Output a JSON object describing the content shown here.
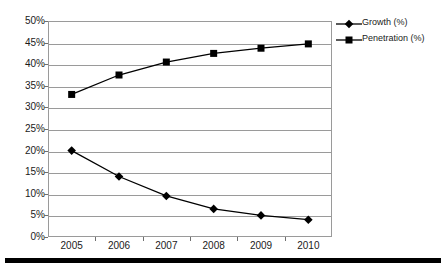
{
  "chart_data": {
    "type": "line",
    "title": "",
    "subtitle": "",
    "xlabel": "",
    "ylabel": "",
    "categories": [
      "2005",
      "2006",
      "2007",
      "2008",
      "2009",
      "2010"
    ],
    "series": [
      {
        "name": "Growth (%)",
        "marker": "diamond",
        "color": "#000000",
        "values": [
          20,
          14,
          9.5,
          6.5,
          5,
          4
        ]
      },
      {
        "name": "Penetration (%)",
        "marker": "square",
        "color": "#000000",
        "values": [
          33,
          37.5,
          40.5,
          42.5,
          43.7,
          44.7
        ]
      }
    ],
    "ylim": [
      0,
      50
    ],
    "ytick_step": 5,
    "ytick_labels": [
      "50%",
      "45%",
      "40%",
      "35%",
      "30%",
      "25%",
      "20%",
      "15%",
      "10%",
      "5%",
      "0%"
    ],
    "ytick_values": [
      50,
      45,
      40,
      35,
      30,
      25,
      20,
      15,
      10,
      5,
      0
    ],
    "grid": true,
    "grid_color": "#9a9a9a",
    "legend_position": "right",
    "plot_border": true,
    "background": "#ffffff"
  },
  "legend": {
    "items": [
      {
        "label": "Growth (%)",
        "marker": "diamond"
      },
      {
        "label": "Penetration (%)",
        "marker": "square"
      }
    ]
  },
  "decoration": {
    "bottom_rule_color": "#000000"
  }
}
